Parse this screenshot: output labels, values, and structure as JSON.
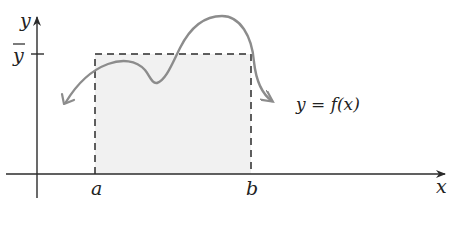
{
  "diagram": {
    "type": "average-value-of-function",
    "colors": {
      "axis": "#2b2b2b",
      "curve": "#8c8c8c",
      "dashed": "#2b2b2b",
      "shade": "#f1f1f1",
      "text": "#222222"
    },
    "axes": {
      "x_label": "x",
      "y_label": "y"
    },
    "labels": {
      "a": "a",
      "b": "b",
      "ybar": "y",
      "curve": "y = f(x)"
    }
  }
}
